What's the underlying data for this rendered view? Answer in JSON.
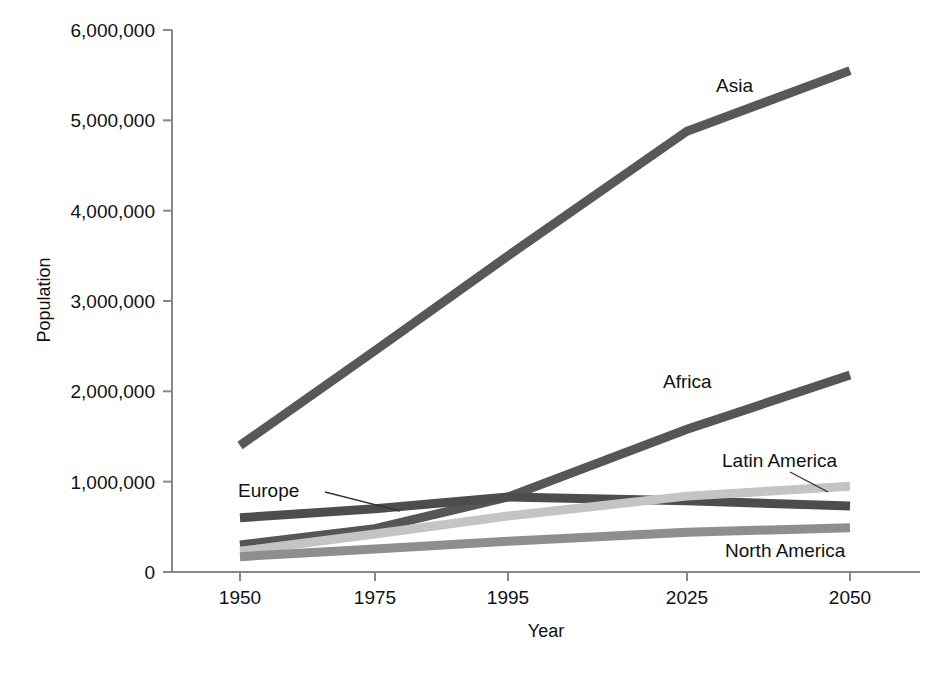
{
  "chart_data": {
    "type": "line",
    "title": "",
    "xlabel": "Year",
    "ylabel": "Population",
    "x": [
      1950,
      1975,
      1995,
      2025,
      2050
    ],
    "xtick_labels": [
      "1950",
      "1975",
      "1995",
      "2025",
      "2050"
    ],
    "ytick_labels": [
      "0",
      "1,000,000",
      "2,000,000",
      "3,000,000",
      "4,000,000",
      "5,000,000",
      "6,000,000"
    ],
    "ytick_values": [
      0,
      1000000,
      2000000,
      3000000,
      4000000,
      5000000,
      6000000
    ],
    "xlim": [
      1950,
      2050
    ],
    "ylim": [
      0,
      6000000
    ],
    "grid": false,
    "legend_position": "inline-labels",
    "series": [
      {
        "name": "Asia",
        "color": "#585858",
        "values": [
          1400000,
          2450000,
          3500000,
          4880000,
          5550000
        ],
        "label_x": 1981,
        "label_y": 5300000
      },
      {
        "name": "Africa",
        "color": "#565656",
        "values": [
          300000,
          480000,
          830000,
          1580000,
          2180000
        ],
        "label_x": 1973,
        "label_y": 2120000
      },
      {
        "name": "Europe",
        "color": "#4d4d4d",
        "values": [
          600000,
          700000,
          830000,
          790000,
          730000
        ],
        "label_x": 1937,
        "label_y": 1020000
      },
      {
        "name": "Latin America",
        "color": "#c4c4c4",
        "values": [
          230000,
          420000,
          620000,
          840000,
          950000
        ],
        "label_x": 1995,
        "label_y": 1150000
      },
      {
        "name": "North America",
        "color": "#8e8e8e",
        "values": [
          170000,
          255000,
          340000,
          440000,
          490000
        ],
        "label_x": 1998,
        "label_y": 330000
      }
    ]
  },
  "axes": {
    "y_axis_name": "population-axis",
    "x_axis_name": "year-axis"
  }
}
